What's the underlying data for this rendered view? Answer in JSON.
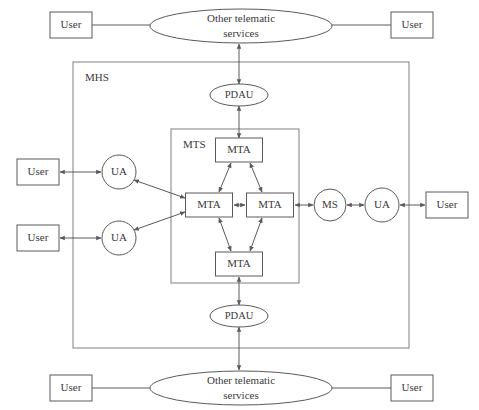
{
  "diagram": {
    "containers": [
      {
        "id": "mhs",
        "label": "MHS",
        "x": 73,
        "y": 62,
        "w": 336,
        "h": 286
      },
      {
        "id": "mts",
        "label": "MTS",
        "x": 171,
        "y": 129,
        "w": 128,
        "h": 154
      }
    ],
    "nodes": [
      {
        "id": "user-tl",
        "label": "User",
        "shape": "rect",
        "cx": 71,
        "cy": 25,
        "w": 42,
        "h": 26
      },
      {
        "id": "user-tr",
        "label": "User",
        "shape": "rect",
        "cx": 412,
        "cy": 25,
        "w": 42,
        "h": 26
      },
      {
        "id": "user-l1",
        "label": "User",
        "shape": "rect",
        "cx": 38,
        "cy": 172,
        "w": 42,
        "h": 26
      },
      {
        "id": "user-l2",
        "label": "User",
        "shape": "rect",
        "cx": 38,
        "cy": 238,
        "w": 42,
        "h": 26
      },
      {
        "id": "user-r1",
        "label": "User",
        "shape": "rect",
        "cx": 447,
        "cy": 205,
        "w": 42,
        "h": 26
      },
      {
        "id": "user-bl",
        "label": "User",
        "shape": "rect",
        "cx": 71,
        "cy": 388,
        "w": 42,
        "h": 26
      },
      {
        "id": "user-br",
        "label": "User",
        "shape": "rect",
        "cx": 412,
        "cy": 388,
        "w": 42,
        "h": 26
      },
      {
        "id": "ots-top",
        "label": "Other telematic services",
        "shape": "ellipse",
        "cx": 241,
        "cy": 26,
        "rx": 91,
        "ry": 17
      },
      {
        "id": "ots-bot",
        "label": "Other telematic services",
        "shape": "ellipse",
        "cx": 241,
        "cy": 388,
        "rx": 91,
        "ry": 17
      },
      {
        "id": "pdau-top",
        "label": "PDAU",
        "shape": "ellipse",
        "cx": 239,
        "cy": 95,
        "rx": 29,
        "ry": 11
      },
      {
        "id": "pdau-bot",
        "label": "PDAU",
        "shape": "ellipse",
        "cx": 239,
        "cy": 316,
        "rx": 29,
        "ry": 11
      },
      {
        "id": "ua-l1",
        "label": "UA",
        "shape": "circle",
        "cx": 119,
        "cy": 172,
        "r": 17
      },
      {
        "id": "ua-l2",
        "label": "UA",
        "shape": "circle",
        "cx": 119,
        "cy": 238,
        "r": 17
      },
      {
        "id": "ms",
        "label": "MS",
        "shape": "circle",
        "cx": 330,
        "cy": 205,
        "r": 16
      },
      {
        "id": "ua-r",
        "label": "UA",
        "shape": "circle",
        "cx": 382,
        "cy": 205,
        "r": 17
      },
      {
        "id": "mta-top",
        "label": "MTA",
        "shape": "rect",
        "cx": 239,
        "cy": 150,
        "w": 47,
        "h": 24
      },
      {
        "id": "mta-left",
        "label": "MTA",
        "shape": "rect",
        "cx": 209,
        "cy": 205,
        "w": 47,
        "h": 24
      },
      {
        "id": "mta-right",
        "label": "MTA",
        "shape": "rect",
        "cx": 270,
        "cy": 205,
        "w": 47,
        "h": 24
      },
      {
        "id": "mta-bot",
        "label": "MTA",
        "shape": "rect",
        "cx": 239,
        "cy": 264,
        "w": 47,
        "h": 24
      }
    ],
    "links": [
      {
        "from": "user-tl",
        "to": "ots-top",
        "arrows": "none",
        "x1": 92,
        "y1": 25,
        "x2": 151,
        "y2": 25
      },
      {
        "from": "ots-top",
        "to": "user-tr",
        "arrows": "none",
        "x1": 331,
        "y1": 25,
        "x2": 391,
        "y2": 25
      },
      {
        "from": "pdau-top",
        "to": "ots-top",
        "arrows": "both",
        "x1": 239,
        "y1": 84,
        "x2": 239,
        "y2": 44
      },
      {
        "from": "mta-top",
        "to": "pdau-top",
        "arrows": "both",
        "x1": 239,
        "y1": 138,
        "x2": 239,
        "y2": 106
      },
      {
        "from": "user-l1",
        "to": "ua-l1",
        "arrows": "both",
        "x1": 60,
        "y1": 172,
        "x2": 101,
        "y2": 172
      },
      {
        "from": "user-l2",
        "to": "ua-l2",
        "arrows": "both",
        "x1": 60,
        "y1": 238,
        "x2": 101,
        "y2": 238
      },
      {
        "from": "ua-l1",
        "to": "mta-left",
        "arrows": "both",
        "x1": 134,
        "y1": 180,
        "x2": 185,
        "y2": 198
      },
      {
        "from": "ua-l2",
        "to": "mta-left",
        "arrows": "both",
        "x1": 134,
        "y1": 230,
        "x2": 185,
        "y2": 212
      },
      {
        "from": "mta-left",
        "to": "mta-top",
        "arrows": "both",
        "x1": 219,
        "y1": 192,
        "x2": 231,
        "y2": 163
      },
      {
        "from": "mta-top",
        "to": "mta-right",
        "arrows": "both",
        "x1": 250,
        "y1": 163,
        "x2": 262,
        "y2": 192
      },
      {
        "from": "mta-left",
        "to": "mta-right",
        "arrows": "both",
        "x1": 234,
        "y1": 205,
        "x2": 245,
        "y2": 205
      },
      {
        "from": "mta-left",
        "to": "mta-bot",
        "arrows": "both",
        "x1": 219,
        "y1": 218,
        "x2": 231,
        "y2": 251
      },
      {
        "from": "mta-bot",
        "to": "mta-right",
        "arrows": "both",
        "x1": 250,
        "y1": 251,
        "x2": 262,
        "y2": 218
      },
      {
        "from": "mta-right",
        "to": "ms",
        "arrows": "both",
        "x1": 295,
        "y1": 205,
        "x2": 313,
        "y2": 205
      },
      {
        "from": "ms",
        "to": "ua-r",
        "arrows": "both",
        "x1": 347,
        "y1": 205,
        "x2": 364,
        "y2": 205
      },
      {
        "from": "ua-r",
        "to": "user-r1",
        "arrows": "both",
        "x1": 400,
        "y1": 205,
        "x2": 425,
        "y2": 205
      },
      {
        "from": "mta-bot",
        "to": "pdau-bot",
        "arrows": "both",
        "x1": 239,
        "y1": 277,
        "x2": 239,
        "y2": 305
      },
      {
        "from": "pdau-bot",
        "to": "ots-bot",
        "arrows": "both",
        "x1": 239,
        "y1": 327,
        "x2": 239,
        "y2": 370
      },
      {
        "from": "user-bl",
        "to": "ots-bot",
        "arrows": "none",
        "x1": 92,
        "y1": 388,
        "x2": 151,
        "y2": 388
      },
      {
        "from": "ots-bot",
        "to": "user-br",
        "arrows": "none",
        "x1": 331,
        "y1": 388,
        "x2": 391,
        "y2": 388
      }
    ],
    "colors": {
      "background": "#ffffff",
      "stroke": "#5a5a5a",
      "container_stroke": "#8a8a8a",
      "text": "#3a3a3a"
    }
  }
}
